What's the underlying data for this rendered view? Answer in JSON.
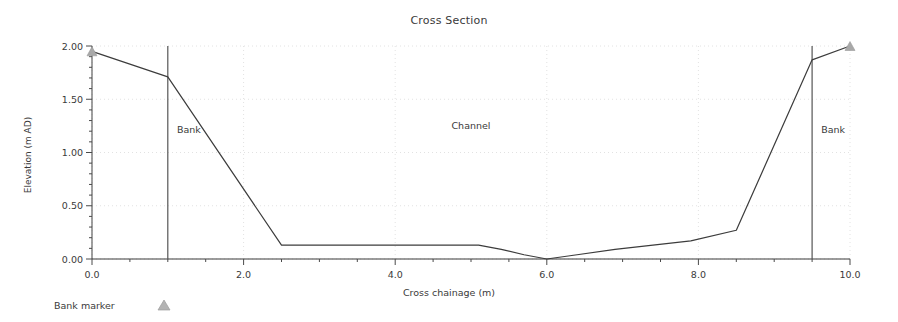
{
  "chart_data": {
    "type": "line",
    "title": "Cross Section",
    "xlabel": "Cross chainage (m)",
    "ylabel": "Elevation (m AD)",
    "xlim": [
      0.0,
      10.0
    ],
    "ylim": [
      0.0,
      2.0
    ],
    "xticks": [
      "0.0",
      "2.0",
      "4.0",
      "6.0",
      "8.0",
      "10.0"
    ],
    "xtick_values": [
      0.0,
      2.0,
      4.0,
      6.0,
      8.0,
      10.0
    ],
    "x_minor_step": 0.5,
    "yticks": [
      "0.00",
      "0.50",
      "1.00",
      "1.50",
      "2.00"
    ],
    "ytick_values": [
      0.0,
      0.5,
      1.0,
      1.5,
      2.0
    ],
    "y_minor_step": 0.1,
    "grid": true,
    "grid_style": "dotted",
    "grid_color": "#e2e2e2",
    "line_color": "#3c3c3c",
    "marker_color": "#a8a8a8",
    "series": [
      {
        "name": "Cross section profile",
        "x": [
          0.0,
          1.0,
          2.5,
          3.2,
          4.2,
          5.1,
          5.4,
          5.7,
          6.0,
          6.4,
          6.9,
          7.4,
          7.9,
          8.5,
          9.5,
          10.0
        ],
        "y": [
          1.95,
          1.71,
          0.13,
          0.13,
          0.13,
          0.13,
          0.09,
          0.04,
          0.0,
          0.04,
          0.09,
          0.13,
          0.17,
          0.27,
          1.87,
          2.0
        ]
      }
    ],
    "markers": [
      {
        "name": "bank-marker-left-end",
        "x": 0.0,
        "y": 1.95
      },
      {
        "name": "bank-marker-right-end",
        "x": 10.0,
        "y": 2.0
      }
    ],
    "bank_lines": [
      {
        "name": "bank-line-left",
        "x": 1.0
      },
      {
        "name": "bank-line-right",
        "x": 9.5
      }
    ],
    "annotations": [
      {
        "name": "annotation-bank-left",
        "text": "Bank",
        "x": 1.12,
        "y": 1.18
      },
      {
        "name": "annotation-channel",
        "text": "Channel",
        "x": 5.0,
        "y": 1.22
      },
      {
        "name": "annotation-bank-right",
        "text": "Bank",
        "x": 9.62,
        "y": 1.18
      }
    ],
    "legend": {
      "position": "below-left",
      "entries": [
        {
          "label": "Bank marker",
          "symbol": "triangle",
          "color": "#a8a8a8"
        }
      ]
    }
  }
}
